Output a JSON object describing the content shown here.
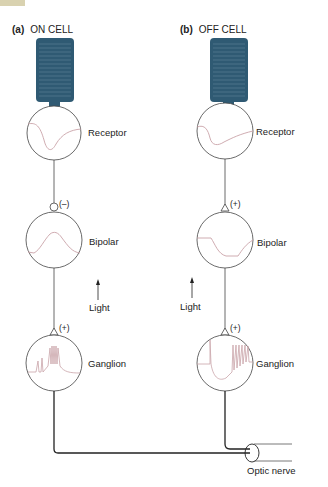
{
  "panels": [
    {
      "id": "a",
      "letter": "(a)",
      "title": "ON CELL",
      "cells": {
        "receptor": "Receptor",
        "bipolar": "Bipolar",
        "ganglion": "Ganglion"
      },
      "synapse_sign": "(–)",
      "ganglion_sign": "(+)",
      "stimulus_label": "Light"
    },
    {
      "id": "b",
      "letter": "(b)",
      "title": "OFF CELL",
      "cells": {
        "receptor": "Receptor",
        "bipolar": "Bipolar",
        "ganglion": "Ganglion"
      },
      "synapse_sign": "(+)",
      "ganglion_sign": "(+)",
      "stimulus_label": "Light"
    }
  ],
  "optic_nerve_label": "Optic nerve",
  "colors": {
    "receptor_fill": "#2f5a73",
    "trace": "#c9a3a8",
    "line": "#333333",
    "corner_tab": "#d9d2b0"
  }
}
